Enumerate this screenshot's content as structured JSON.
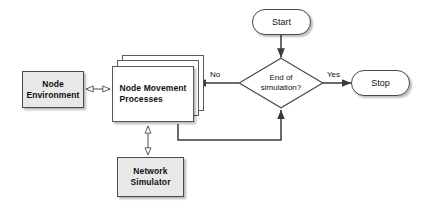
{
  "diagram": {
    "background_color": "#ffffff",
    "fill_gray": "#e8e8e8",
    "fill_white": "#ffffff",
    "stroke_color": "#4a4a4a",
    "text_color": "#111111"
  },
  "nodes": {
    "node_environment": {
      "label_line1": "Node",
      "label_line2": "Environment",
      "shape": "rectangle",
      "fill": "#e8e8e8"
    },
    "node_movement_processes": {
      "label_line1": "Node Movement",
      "label_line2": "Processes",
      "shape": "stacked-process",
      "layers": 3,
      "fill": "#ffffff"
    },
    "network_simulator": {
      "label_line1": "Network",
      "label_line2": "Simulator",
      "shape": "rectangle",
      "fill": "#e8e8e8"
    },
    "start": {
      "label": "Start",
      "shape": "terminal",
      "fill": "#ffffff"
    },
    "stop": {
      "label": "Stop",
      "shape": "terminal",
      "fill": "#ffffff"
    },
    "decision": {
      "label_line1": "End of",
      "label_line2": "simulation?",
      "shape": "diamond",
      "fill": "#ffffff"
    }
  },
  "edges": {
    "env_to_processes": {
      "label": "",
      "style": "double-arrow-open"
    },
    "processes_to_simulator": {
      "label": "",
      "style": "double-arrow-open"
    },
    "start_to_decision": {
      "label": "",
      "style": "arrow-filled"
    },
    "decision_no_to_processes": {
      "label": "No",
      "style": "arrow-filled"
    },
    "decision_yes_to_stop": {
      "label": "Yes",
      "style": "arrow-filled"
    },
    "processes_back_to_decision": {
      "label": "",
      "style": "arrow-filled"
    }
  }
}
